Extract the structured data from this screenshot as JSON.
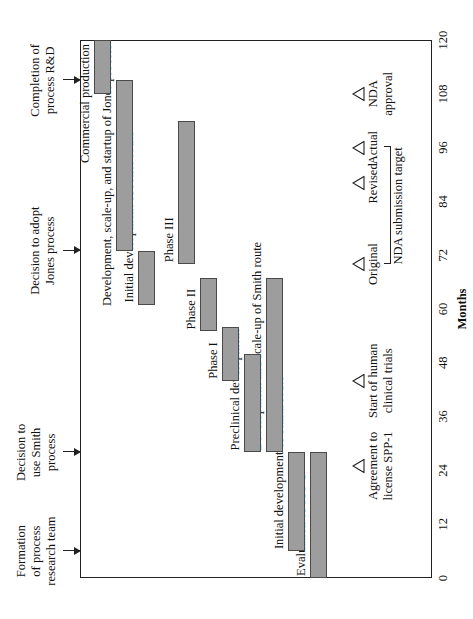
{
  "chart_data": {
    "type": "bar",
    "orientation": "gantt-horizontal",
    "title": "",
    "xlabel": "Months",
    "ylabel": "",
    "xlim": [
      0,
      120
    ],
    "grid": false,
    "legend": "none",
    "tick_labels": [
      "0",
      "12",
      "24",
      "36",
      "48",
      "60",
      "72",
      "84",
      "96",
      "108",
      "120"
    ],
    "tick_values": [
      0,
      12,
      24,
      36,
      48,
      60,
      72,
      84,
      96,
      108,
      120
    ],
    "bar_color": "#9d9d9d",
    "tasks": [
      {
        "label": "Evaluation of SPP-1",
        "start": 0,
        "end": 28
      },
      {
        "label": "Initial development of Smith route",
        "start": 6,
        "end": 28
      },
      {
        "label": "Development and scale-up of Smith route",
        "start": 28,
        "end": 67
      },
      {
        "label": "Preclinical development",
        "start": 28,
        "end": 50
      },
      {
        "label": "Phase I",
        "start": 44,
        "end": 56
      },
      {
        "label": "Phase II",
        "start": 55,
        "end": 67
      },
      {
        "label": "Phase III",
        "start": 70,
        "end": 102
      },
      {
        "label": "Initial development of Jones route",
        "start": 61,
        "end": 73
      },
      {
        "label": "Development, scale-up, and startup of Jones process",
        "start": 73,
        "end": 111
      },
      {
        "label": "Commercial production",
        "start": 108,
        "end": 120
      }
    ],
    "milestone_arrows": [
      {
        "label": "Formation\nof process\nresearch team",
        "month": 6
      },
      {
        "label": "Decision to\nuse Smith\nprocess",
        "month": 28
      },
      {
        "label": "Decision to adopt\nJones process",
        "month": 73
      },
      {
        "label": "Completion of\nprocess R&D",
        "month": 111
      }
    ],
    "milestone_triangles": [
      {
        "label": "Agreement to\nlicense SPP-1",
        "month": 25
      },
      {
        "label": "Start of human\nclinical trials",
        "month": 44
      },
      {
        "label": "Original",
        "month": 70
      },
      {
        "label": "Revised",
        "month": 88
      },
      {
        "label": "Actual",
        "month": 96
      },
      {
        "label": "NDA\napproval",
        "month": 108
      }
    ],
    "bracket": {
      "label": "NDA submission target",
      "from_month": 70,
      "to_month": 96
    }
  },
  "figure": {
    "axis_title": "Months"
  }
}
